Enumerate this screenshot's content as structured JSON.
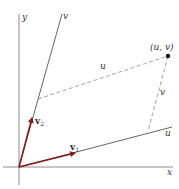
{
  "diagram": {
    "axes": {
      "x_label": "x",
      "y_label": "y",
      "u_axis_label": "u",
      "v_axis_label": "v"
    },
    "point": {
      "label": "(u, v)"
    },
    "projections": {
      "u_segment_label": "u",
      "v_segment_label": "v"
    },
    "vectors": [
      {
        "name": "v",
        "subscript": "1"
      },
      {
        "name": "v",
        "subscript": "2"
      }
    ],
    "colors": {
      "axis": "#6e6e6e",
      "vector": "#8b1a1a",
      "dashed": "#7a7a7a",
      "point": "#111111",
      "text": "#333333"
    }
  }
}
